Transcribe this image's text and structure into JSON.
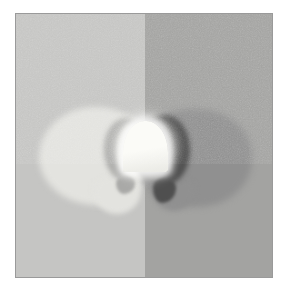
{
  "image": {
    "title": "Wall-mounted dome lamp on two-tone wall",
    "description": "A glowing white half-dome wall lamp mounted at the vertical seam between a light gray wall panel on the left and a darker gray wall panel on the right, casting a pale halo to the left and a dark crescent shadow to the right.",
    "medium": "grayscale photograph",
    "orientation": "portrait",
    "frame": {
      "border_color": "#9a9a9a",
      "mat_color": "#ffffff"
    }
  },
  "palette": {
    "wall_left": "#c5c5c3",
    "wall_right": "#a3a3a1",
    "glow_left": "#e3e3df",
    "glow_right": "#909090",
    "crescent_left": "#a9a9a7",
    "crescent_right": "#4f4f4f",
    "lamp_white": "#fbfbf7",
    "lamp_shade": "#e9e9e4",
    "border": "#9a9a9a",
    "background": "#ffffff"
  },
  "regions": [
    {
      "name": "wall-panel-left",
      "label": "Light wall panel",
      "tone": "light gray",
      "color": "#c5c5c3"
    },
    {
      "name": "wall-panel-right",
      "label": "Dark wall panel",
      "tone": "medium gray",
      "color": "#a3a3a1"
    },
    {
      "name": "glow-halo-left",
      "label": "Light halo spill",
      "tone": "near white",
      "color": "#e3e3df"
    },
    {
      "name": "glow-halo-right",
      "label": "Dim halo spill",
      "tone": "dark gray",
      "color": "#909090"
    },
    {
      "name": "shadow-crescent-left",
      "label": "Soft crescent shadow",
      "tone": "gray",
      "color": "#a9a9a7"
    },
    {
      "name": "shadow-crescent-right",
      "label": "Deep crescent shadow",
      "tone": "near black",
      "color": "#4f4f4f"
    },
    {
      "name": "lamp-dome",
      "label": "Illuminated dome lamp",
      "tone": "white",
      "color": "#fbfbf7"
    }
  ]
}
